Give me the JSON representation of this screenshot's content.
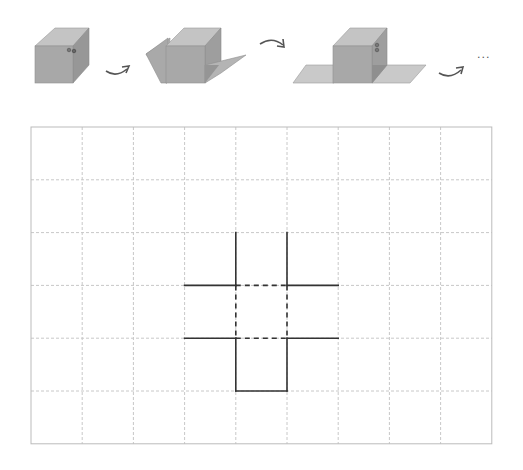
{
  "diagram": {
    "steps": [
      {
        "id": "step-1",
        "description": "closed cube with two marked dots on top-right edge"
      },
      {
        "id": "step-2",
        "description": "cube with left and right faces unfolding"
      },
      {
        "id": "step-3",
        "description": "cube with left and right faces laid flat"
      },
      {
        "id": "step-4",
        "description": "continuation"
      }
    ],
    "continuation_text": "...",
    "colors": {
      "cube_front": "#a8a8a8",
      "cube_top": "#c4c4c4",
      "cube_side": "#979797",
      "flap": "#b4b4b4",
      "flat_face": "#c9c9c9",
      "arrow": "#555555",
      "grid_dash": "#c8c8c8",
      "grid_border": "#bbbbbb",
      "net_line": "#333333"
    }
  },
  "grid": {
    "columns": 9,
    "rows": 6,
    "origin_x": 31,
    "origin_y": 127,
    "cell_width": 51.2,
    "cell_height": 52.8,
    "net": {
      "solid_segments": [
        [
          [
            4,
            2
          ],
          [
            4,
            3
          ]
        ],
        [
          [
            5,
            2
          ],
          [
            5,
            3
          ]
        ],
        [
          [
            3,
            3
          ],
          [
            4,
            3
          ]
        ],
        [
          [
            5,
            3
          ],
          [
            6,
            3
          ]
        ],
        [
          [
            3,
            4
          ],
          [
            4,
            4
          ]
        ],
        [
          [
            5,
            4
          ],
          [
            6,
            4
          ]
        ],
        [
          [
            4,
            4
          ],
          [
            4,
            5
          ]
        ],
        [
          [
            5,
            4
          ],
          [
            5,
            5
          ]
        ],
        [
          [
            4,
            5
          ],
          [
            5,
            5
          ]
        ]
      ],
      "dashed_segments": [
        [
          [
            4,
            3
          ],
          [
            5,
            3
          ]
        ],
        [
          [
            4,
            3
          ],
          [
            4,
            4
          ]
        ],
        [
          [
            5,
            3
          ],
          [
            5,
            4
          ]
        ],
        [
          [
            4,
            4
          ],
          [
            5,
            4
          ]
        ]
      ]
    }
  }
}
